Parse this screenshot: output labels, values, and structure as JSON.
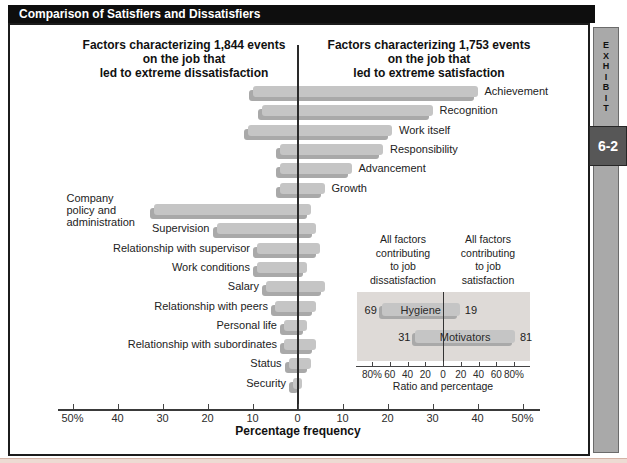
{
  "figure": {
    "title": "Comparison of Satisfiers and Dissatisfiers"
  },
  "exhibit_tab": {
    "label": "EXHIBIT",
    "number": "6-2"
  },
  "headers": {
    "left": "Factors characterizing 1,844 events\non the job that\nled to extreme dissatisfaction",
    "right": "Factors characterizing 1,753 events\non the job that\nled to extreme satisfaction"
  },
  "chart_data": [
    {
      "type": "bar",
      "subtype": "diverging-horizontal",
      "title": "Comparison of Satisfiers and Dissatisfiers",
      "xlabel": "Percentage frequency",
      "xlim": [
        -50,
        50
      ],
      "legend_position": "none",
      "grid": false,
      "ticks": [
        {
          "v": -50,
          "label": "50%"
        },
        {
          "v": -40,
          "label": "40"
        },
        {
          "v": -30,
          "label": "30"
        },
        {
          "v": -20,
          "label": "20"
        },
        {
          "v": -10,
          "label": "10"
        },
        {
          "v": 0,
          "label": "0"
        },
        {
          "v": 10,
          "label": "10"
        },
        {
          "v": 20,
          "label": "20"
        },
        {
          "v": 30,
          "label": "30"
        },
        {
          "v": 40,
          "label": "40"
        },
        {
          "v": 50,
          "label": "50%"
        }
      ],
      "factors": [
        {
          "label": "Achievement",
          "group": "satisfier",
          "dissatisfaction": 10,
          "satisfaction": 40
        },
        {
          "label": "Recognition",
          "group": "satisfier",
          "dissatisfaction": 8,
          "satisfaction": 30
        },
        {
          "label": "Work itself",
          "group": "satisfier",
          "dissatisfaction": 11,
          "satisfaction": 21
        },
        {
          "label": "Responsibility",
          "group": "satisfier",
          "dissatisfaction": 4,
          "satisfaction": 19
        },
        {
          "label": "Advancement",
          "group": "satisfier",
          "dissatisfaction": 4,
          "satisfaction": 12
        },
        {
          "label": "Growth",
          "group": "satisfier",
          "dissatisfaction": 4,
          "satisfaction": 6
        },
        {
          "label": "Company policy and administration",
          "label_lines": [
            "Company",
            "policy and",
            "administration"
          ],
          "group": "dissatisfier",
          "dissatisfaction": 32,
          "satisfaction": 3
        },
        {
          "label": "Supervision",
          "group": "dissatisfier",
          "dissatisfaction": 18,
          "satisfaction": 4
        },
        {
          "label": "Relationship with supervisor",
          "group": "dissatisfier",
          "dissatisfaction": 9,
          "satisfaction": 5
        },
        {
          "label": "Work conditions",
          "group": "dissatisfier",
          "dissatisfaction": 9,
          "satisfaction": 2
        },
        {
          "label": "Salary",
          "group": "dissatisfier",
          "dissatisfaction": 7,
          "satisfaction": 6
        },
        {
          "label": "Relationship with peers",
          "group": "dissatisfier",
          "dissatisfaction": 5,
          "satisfaction": 4
        },
        {
          "label": "Personal life",
          "group": "dissatisfier",
          "dissatisfaction": 3,
          "satisfaction": 2
        },
        {
          "label": "Relationship with subordinates",
          "group": "dissatisfier",
          "dissatisfaction": 3,
          "satisfaction": 4
        },
        {
          "label": "Status",
          "group": "dissatisfier",
          "dissatisfaction": 2,
          "satisfaction": 3
        },
        {
          "label": "Security",
          "group": "dissatisfier",
          "dissatisfaction": 1,
          "satisfaction": 1
        }
      ]
    },
    {
      "type": "bar",
      "subtype": "diverging-horizontal-inset",
      "headers": {
        "left": "All factors\ncontributing\nto job\ndissatisfaction",
        "right": "All factors\ncontributing\nto job\nsatisfaction"
      },
      "xlabel": "Ratio and percentage",
      "xlim": [
        -80,
        80
      ],
      "ticks": [
        {
          "v": -80,
          "label": "80%"
        },
        {
          "v": -60,
          "label": "60"
        },
        {
          "v": -40,
          "label": "40"
        },
        {
          "v": -20,
          "label": "20"
        },
        {
          "v": 0,
          "label": "0"
        },
        {
          "v": 20,
          "label": "20"
        },
        {
          "v": 40,
          "label": "40"
        },
        {
          "v": 60,
          "label": "60"
        },
        {
          "v": 80,
          "label": "80%"
        }
      ],
      "rows": [
        {
          "label": "Hygiene",
          "dissatisfaction": 69,
          "satisfaction": 19
        },
        {
          "label": "Motivators",
          "dissatisfaction": 31,
          "satisfaction": 81
        }
      ]
    }
  ],
  "colors": {
    "bar": "#c5c5c5",
    "bar_shadow": "#a9a9a9",
    "title_bar_bg": "#0e0e0e",
    "title_text": "#ffffff",
    "inset_panel_bg": "#dedad7",
    "exhibit_strip_bg": "#a9a9a9",
    "exhibit_box_bg": "#575757"
  }
}
